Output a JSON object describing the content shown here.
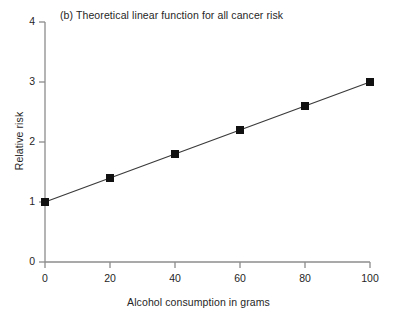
{
  "chart_data": {
    "type": "line",
    "title": "(b) Theoretical linear function for all cancer risk",
    "xlabel": "Alcohol consumption in grams",
    "ylabel": "Relative risk",
    "x": [
      0,
      20,
      40,
      60,
      80,
      100
    ],
    "values": [
      1.0,
      1.4,
      1.8,
      2.2,
      2.6,
      3.0
    ],
    "series": [
      {
        "name": "Theoretical linear function",
        "values": [
          1.0,
          1.4,
          1.8,
          2.2,
          2.6,
          3.0
        ]
      }
    ],
    "xlim": [
      0,
      100
    ],
    "ylim": [
      0,
      4
    ],
    "xticks": [
      0,
      20,
      40,
      60,
      80,
      100
    ],
    "yticks": [
      0,
      1,
      2,
      3,
      4
    ],
    "xtick_labels": [
      "0",
      "20",
      "40",
      "60",
      "80",
      "100"
    ],
    "ytick_labels": [
      "0",
      "1",
      "2",
      "3",
      "4"
    ],
    "grid": false,
    "legend": false,
    "marker": "filled-square",
    "line_color": "#3a3a3a",
    "marker_color": "#111111",
    "axis_color": "#8c8c8c",
    "background_color": "#ffffff"
  }
}
